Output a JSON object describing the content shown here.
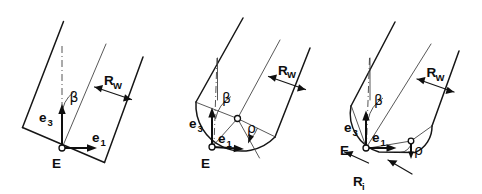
{
  "diagram": {
    "background_color": "#ffffff",
    "line_color": "#161616",
    "width": 482,
    "height": 194,
    "panel_count": 3
  },
  "panels": [
    {
      "id": "panel-1",
      "name": "sharp-corner-variant",
      "labels": {
        "origin": "E",
        "vector_x": "e",
        "vector_x_sub": "1",
        "vector_y": "e",
        "vector_y_sub": "3",
        "angle": "β",
        "width": "R",
        "width_sub": "W"
      }
    },
    {
      "id": "panel-2",
      "name": "full-round-variant",
      "labels": {
        "origin": "E",
        "vector_x": "e",
        "vector_x_sub": "1",
        "vector_y": "e",
        "vector_y_sub": "3",
        "angle": "β",
        "width": "R",
        "width_sub": "W",
        "radius_angle": "ρ"
      }
    },
    {
      "id": "panel-3",
      "name": "inner-radius-variant",
      "labels": {
        "origin": "E",
        "vector_x": "e",
        "vector_x_sub": "1",
        "vector_y": "e",
        "vector_y_sub": "3",
        "angle": "β",
        "width": "R",
        "width_sub": "W",
        "radius_angle": "ρ",
        "inner_radius": "R",
        "inner_radius_sub": "i"
      }
    }
  ]
}
